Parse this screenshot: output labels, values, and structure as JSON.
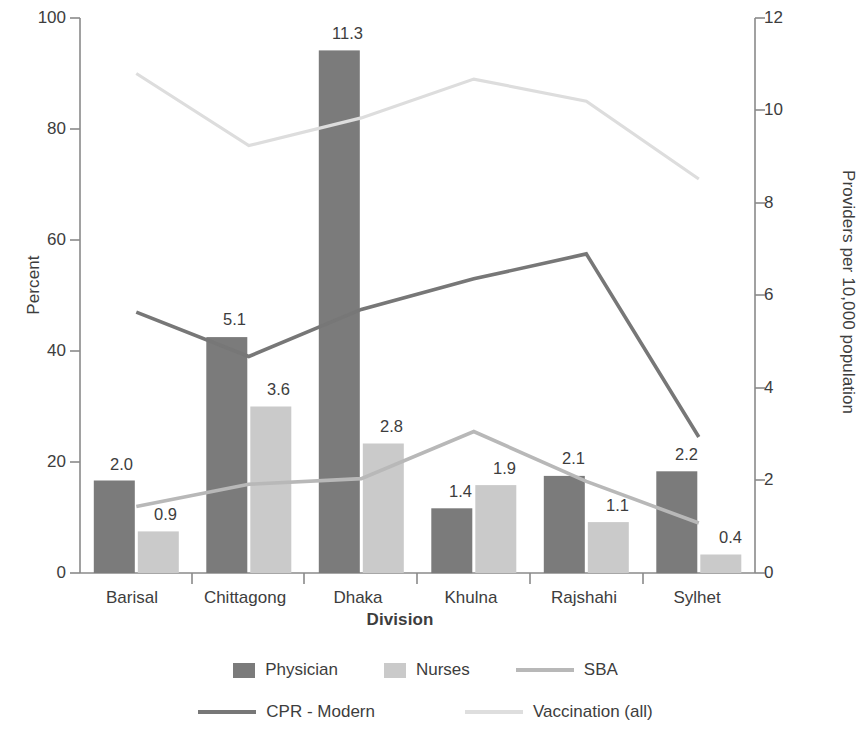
{
  "chart_data": {
    "type": "bar",
    "title": "",
    "subtitle": "",
    "xlabel": "Division",
    "ylabel": "Percent",
    "ylabel_secondary": "Providers per 10,000 population",
    "categories": [
      "Barisal",
      "Chittagong",
      "Dhaka",
      "Khulna",
      "Rajshahi",
      "Sylhet"
    ],
    "ylim": [
      0,
      100
    ],
    "yticks": [
      "0",
      "20",
      "40",
      "60",
      "80",
      "100"
    ],
    "ylim_secondary": [
      0,
      12
    ],
    "yticks_secondary": [
      "0",
      "2",
      "4",
      "6",
      "8",
      "10",
      "12"
    ],
    "grid": false,
    "legend_position": "bottom",
    "bar_series": [
      {
        "name": "Physician",
        "axis": "right",
        "color": "#7b7b7b",
        "values": [
          2.0,
          5.1,
          11.3,
          1.4,
          2.1,
          2.2
        ],
        "labels": [
          "2.0",
          "5.1",
          "11.3",
          "1.4",
          "2.1",
          "2.2"
        ]
      },
      {
        "name": "Nurses",
        "axis": "right",
        "color": "#cacaca",
        "values": [
          0.9,
          3.6,
          2.8,
          1.9,
          1.1,
          0.4
        ],
        "labels": [
          "0.9",
          "3.6",
          "2.8",
          "1.9",
          "1.1",
          "0.4"
        ]
      }
    ],
    "line_series": [
      {
        "name": "SBA",
        "axis": "left",
        "color": "#b8b8b8",
        "values": [
          12.0,
          16.0,
          17.0,
          25.5,
          16.5,
          9.0
        ]
      },
      {
        "name": "CPR - Modern",
        "axis": "left",
        "color": "#777777",
        "values": [
          47.0,
          39.0,
          47.5,
          53.0,
          57.5,
          24.5
        ]
      },
      {
        "name": "Vaccination (all)",
        "axis": "left",
        "color": "#dddddd",
        "values": [
          90.0,
          77.0,
          82.0,
          89.0,
          85.0,
          71.0
        ]
      }
    ]
  },
  "axes": {
    "left_title": "Percent",
    "right_title": "Providers per 10,000 population",
    "x_title": "Division",
    "left_ticks": [
      "100",
      "80",
      "60",
      "40",
      "20",
      "0"
    ],
    "right_ticks": [
      "12",
      "10",
      "8",
      "6",
      "4",
      "2",
      "0"
    ]
  },
  "categories": [
    "Barisal",
    "Chittagong",
    "Dhaka",
    "Khulna",
    "Rajshahi",
    "Sylhet"
  ],
  "bar_labels": {
    "physician": [
      "2.0",
      "5.1",
      "11.3",
      "1.4",
      "2.1",
      "2.2"
    ],
    "nurses": [
      "0.9",
      "3.6",
      "2.8",
      "1.9",
      "1.1",
      "0.4"
    ]
  },
  "legend": {
    "row1": [
      {
        "label": "Physician",
        "type": "swatch",
        "color": "#7b7b7b"
      },
      {
        "label": "Nurses",
        "type": "swatch",
        "color": "#cacaca"
      },
      {
        "label": "SBA",
        "type": "line",
        "color": "#b8b8b8"
      }
    ],
    "row2": [
      {
        "label": "CPR - Modern",
        "type": "line",
        "color": "#777777"
      },
      {
        "label": "Vaccination (all)",
        "type": "line",
        "color": "#dddddd"
      }
    ]
  },
  "colors": {
    "physician": "#7b7b7b",
    "nurses": "#cacaca",
    "sba": "#b8b8b8",
    "cpr": "#777777",
    "vaccination": "#dddddd",
    "axis": "#8a8a8a",
    "text": "#3d3d3d"
  }
}
